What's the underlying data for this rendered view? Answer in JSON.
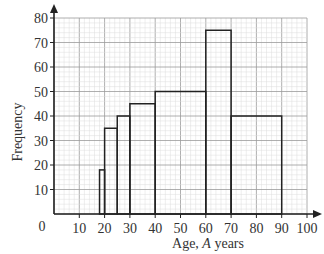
{
  "chart_data": {
    "type": "histogram",
    "title": "",
    "xlabel_prefix": "Age, ",
    "xlabel_var": "A",
    "xlabel_suffix": " years",
    "xlabel": "Age, A years",
    "ylabel": "Frequency",
    "xlim": [
      0,
      100
    ],
    "ylim": [
      0,
      80
    ],
    "grid": true,
    "x_ticks": [
      10,
      20,
      30,
      40,
      50,
      60,
      70,
      80,
      90,
      100
    ],
    "y_ticks": [
      10,
      20,
      30,
      40,
      50,
      60,
      70,
      80
    ],
    "origin_label": "0",
    "bars": [
      {
        "x0": 18,
        "x1": 20,
        "height": 18
      },
      {
        "x0": 20,
        "x1": 25,
        "height": 35
      },
      {
        "x0": 25,
        "x1": 30,
        "height": 40
      },
      {
        "x0": 30,
        "x1": 40,
        "height": 45
      },
      {
        "x0": 40,
        "x1": 60,
        "height": 50
      },
      {
        "x0": 60,
        "x1": 70,
        "height": 75
      },
      {
        "x0": 70,
        "x1": 90,
        "height": 40
      }
    ],
    "colors": {
      "bar_stroke": "#222222",
      "bar_fill": "none",
      "grid_major": "#9a9a9a",
      "grid_minor": "#dcdcdc",
      "axis": "#222222"
    }
  }
}
